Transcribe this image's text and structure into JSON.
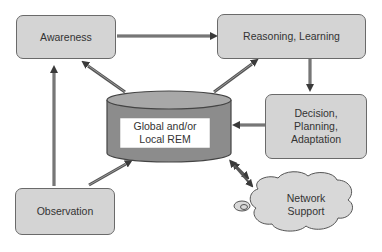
{
  "diagram": {
    "nodes": {
      "awareness": "Awareness",
      "reasoning": "Reasoning, Learning",
      "decision_1": "Decision,",
      "decision_2": "Planning,",
      "decision_3": "Adaptation",
      "rem_1": "Global and/or",
      "rem_2": "Local REM",
      "observation": "Observation",
      "network_1": "Network",
      "network_2": "Support"
    },
    "edges": [
      {
        "from": "Awareness",
        "to": "Reasoning, Learning"
      },
      {
        "from": "Reasoning, Learning",
        "to": "Decision, Planning, Adaptation"
      },
      {
        "from": "Decision, Planning, Adaptation",
        "to": "Global and/or Local REM"
      },
      {
        "from": "Global and/or Local REM",
        "to": "Awareness"
      },
      {
        "from": "Global and/or Local REM",
        "to": "Reasoning, Learning"
      },
      {
        "from": "Observation",
        "to": "Awareness"
      },
      {
        "from": "Observation",
        "to": "Global and/or Local REM"
      },
      {
        "from": "Global and/or Local REM",
        "to": "Network Support",
        "bidirectional": true
      }
    ],
    "colors": {
      "box_fill": "#d4d4d4",
      "box_border": "#6a6a6a",
      "arrow": "#555555",
      "cylinder": "#8c8c8c"
    }
  }
}
